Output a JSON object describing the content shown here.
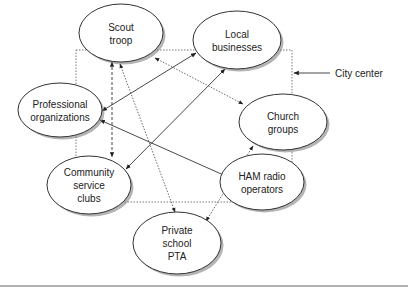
{
  "diagram": {
    "boundary_label": "City center",
    "nodes": [
      {
        "id": "scout",
        "lines": [
          "Scout",
          "troop"
        ]
      },
      {
        "id": "local",
        "lines": [
          "Local",
          "businesses"
        ]
      },
      {
        "id": "prof",
        "lines": [
          "Professional",
          "organizations"
        ]
      },
      {
        "id": "church",
        "lines": [
          "Church",
          "groups"
        ]
      },
      {
        "id": "community",
        "lines": [
          "Community",
          "service",
          "clubs"
        ]
      },
      {
        "id": "ham",
        "lines": [
          "HAM radio",
          "operators"
        ]
      },
      {
        "id": "pta",
        "lines": [
          "Private",
          "school",
          "PTA"
        ]
      }
    ],
    "edges": [
      {
        "from": "scout",
        "to": "community",
        "style": "dashed",
        "direction": "both"
      },
      {
        "from": "prof",
        "to": "local",
        "style": "solid",
        "direction": "both"
      },
      {
        "from": "local",
        "to": "community",
        "style": "solid",
        "direction": "both"
      },
      {
        "from": "scout",
        "to": "church",
        "style": "dotted",
        "direction": "both"
      },
      {
        "from": "prof",
        "to": "ham",
        "style": "solid",
        "direction": "both"
      },
      {
        "from": "scout",
        "to": "pta",
        "style": "dotted",
        "direction": "both"
      },
      {
        "from": "church",
        "to": "pta",
        "style": "dotted",
        "direction": "both"
      }
    ]
  }
}
